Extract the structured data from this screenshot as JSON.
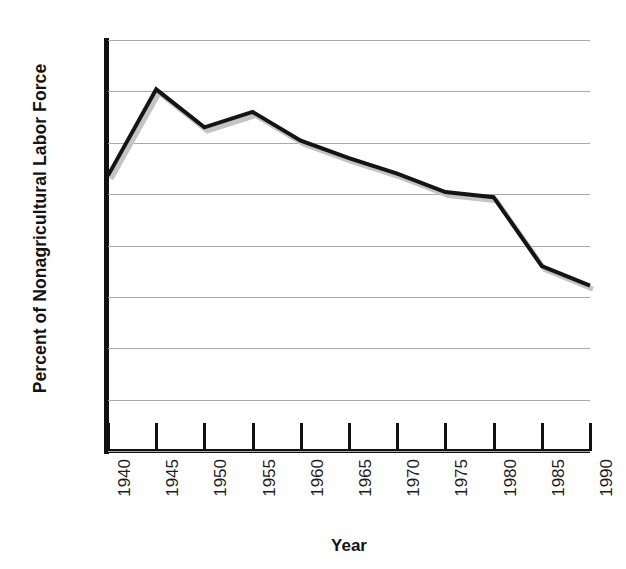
{
  "top_caption_sliver": "",
  "chart_data": {
    "type": "line",
    "title": "",
    "xlabel": "Year",
    "ylabel": "Percent of Nonagricultural Labor Force",
    "x": [
      1940,
      1945,
      1950,
      1955,
      1960,
      1965,
      1970,
      1975,
      1980,
      1985,
      1990
    ],
    "xtick_labels": [
      "1940",
      "1945",
      "1950",
      "1955",
      "1960",
      "1965",
      "1970",
      "1975",
      "1980",
      "1985",
      "1990"
    ],
    "xlim": [
      1940,
      1990
    ],
    "ylim": [
      0,
      40
    ],
    "ytick_labels": [
      "40",
      "35",
      "30",
      "25",
      "20",
      "15",
      "10",
      "5",
      "0"
    ],
    "yticks": [
      40,
      35,
      30,
      25,
      20,
      15,
      10,
      5,
      0
    ],
    "grid": "horizontal",
    "legend": "none",
    "series": [
      {
        "name": "Union membership as percent of nonagricultural labor force",
        "values": [
          26.8,
          35.2,
          31.5,
          33.0,
          30.2,
          28.5,
          27.0,
          25.2,
          24.7,
          18.0,
          16.1
        ],
        "line_color": "#141414",
        "shadow_color": "#c4c4c4",
        "line_width": 4
      }
    ],
    "colors": {
      "axis": "#111111",
      "gridline": "#a9a9ad",
      "text": "#1d1d1d",
      "background": "#ffffff"
    }
  }
}
